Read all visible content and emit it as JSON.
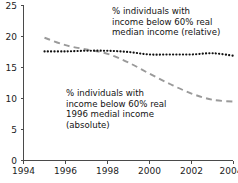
{
  "chart_data": {
    "type": "line",
    "title": "",
    "subtitle": "",
    "xlabel": "",
    "ylabel": "",
    "xlim": [
      1994,
      2004
    ],
    "ylim": [
      0,
      25
    ],
    "grid": false,
    "legend_position": "inline-annotations",
    "x_ticks": [
      "1994",
      "1996",
      "1998",
      "2000",
      "2002",
      "2004"
    ],
    "x_tick_values": [
      1994,
      1996,
      1998,
      2000,
      2002,
      2004
    ],
    "y_ticks": [
      "0",
      "5",
      "10",
      "15",
      "20",
      "25"
    ],
    "y_tick_values": [
      0,
      5,
      10,
      15,
      20,
      25
    ],
    "x": [
      1995,
      1996,
      1997,
      1998,
      1999,
      2000,
      2001,
      2002,
      2003,
      2004
    ],
    "series": [
      {
        "name": "% individuals with income below 60% real median income (relative)",
        "short_name": "relative",
        "style": "dotted",
        "color": "#111111",
        "values": [
          17.6,
          17.6,
          17.7,
          17.7,
          17.5,
          17.1,
          17.1,
          17.1,
          17.3,
          16.9
        ]
      },
      {
        "name": "% individuals with income below 60% real 1996 medial income (absolute)",
        "short_name": "absolute",
        "style": "dashed",
        "color": "#9a9a9a",
        "values": [
          19.8,
          18.6,
          17.9,
          17.2,
          15.8,
          14.0,
          12.3,
          10.8,
          9.8,
          9.5
        ]
      }
    ],
    "annotations": [
      {
        "id": "relative",
        "text": "% individuals with\nincome below 60% real\nmedian income (relative)"
      },
      {
        "id": "absolute",
        "text": "% individuals with\nincome below 60% real\n1996 medial income\n(absolute)"
      }
    ]
  },
  "axis": {
    "y_tick_0": "0",
    "y_tick_1": "5",
    "y_tick_2": "10",
    "y_tick_3": "15",
    "y_tick_4": "20",
    "y_tick_5": "25",
    "x_tick_0": "1994",
    "x_tick_1": "1996",
    "x_tick_2": "1998",
    "x_tick_3": "2000",
    "x_tick_4": "2002",
    "x_tick_5": "2004"
  },
  "annotations": {
    "relative_text": "% individuals with\nincome below 60% real\nmedian income (relative)",
    "absolute_text": "% individuals with\nincome below 60% real\n1996 medial income\n(absolute)"
  },
  "colors": {
    "relative_series": "#111111",
    "absolute_series": "#9a9a9a",
    "axis": "#4a4a4a",
    "text": "#131313",
    "background": "#ffffff"
  }
}
